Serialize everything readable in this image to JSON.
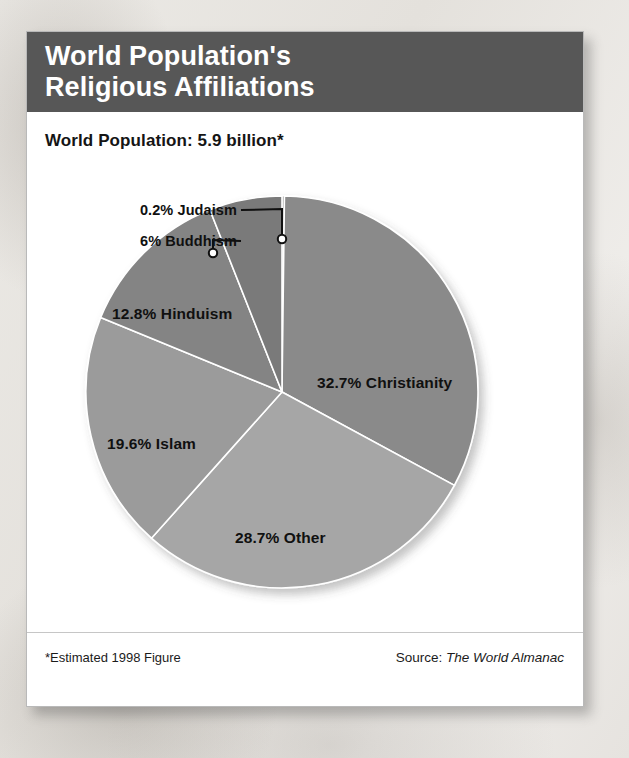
{
  "card": {
    "header": {
      "title_line_1": "World Population's",
      "title_line_2": "Religious Affiliations",
      "background_color": "#575757",
      "text_color": "#ffffff"
    },
    "subtitle": "World Population: 5.9 billion*",
    "footer": {
      "footnote": "*Estimated 1998 Figure",
      "source_prefix": "Source:",
      "source_title": "The World Almanac"
    }
  },
  "chart_data": {
    "type": "pie",
    "title": "World Population's Religious Affiliations",
    "subtitle": "World Population: 5.9 billion*",
    "unit": "percent",
    "total_population": "5.9 billion",
    "start_angle_deg": 0,
    "direction": "clockwise",
    "legend": "none-labels-on-slices",
    "categories": [
      "Judaism",
      "Christianity",
      "Other",
      "Islam",
      "Hinduism",
      "Buddhism"
    ],
    "values": [
      0.2,
      32.7,
      28.7,
      19.6,
      12.8,
      6.0
    ],
    "slices": [
      {
        "name": "Judaism",
        "value": 0.2,
        "label": "0.2% Judaism",
        "color": "#8d8d8d",
        "label_type": "callout",
        "callout_anchor_x": 197,
        "callout_anchor_y": 44
      },
      {
        "name": "Christianity",
        "value": 32.7,
        "label": "32.7% Christianity",
        "color": "#8a8a8a",
        "label_type": "inside",
        "label_x": 232,
        "label_y": 179
      },
      {
        "name": "Other",
        "value": 28.7,
        "label": "28.7% Other",
        "color": "#a6a6a6",
        "label_type": "inside",
        "label_x": 150,
        "label_y": 334
      },
      {
        "name": "Islam",
        "value": 19.6,
        "label": "19.6% Islam",
        "color": "#9b9b9b",
        "label_type": "inside",
        "label_x": 22,
        "label_y": 240
      },
      {
        "name": "Hinduism",
        "value": 12.8,
        "label": "12.8% Hinduism",
        "color": "#848484",
        "label_type": "inside",
        "label_x": 27,
        "label_y": 110
      },
      {
        "name": "Buddhism",
        "value": 6.0,
        "label": "6% Buddhism",
        "color": "#7a7a7a",
        "label_type": "callout",
        "callout_anchor_x": 128,
        "callout_anchor_y": 58
      }
    ],
    "callouts": [
      {
        "name": "Judaism",
        "label": "0.2% Judaism",
        "label_x": 60,
        "label_y": 7,
        "elbow_x": 197,
        "elbow_y": 14,
        "point_x": 197,
        "point_y": 44
      },
      {
        "name": "Buddhism",
        "label": "6% Buddhism",
        "label_x": 60,
        "label_y": 38,
        "elbow_x": 128,
        "elbow_y": 45,
        "point_x": 128,
        "point_y": 58
      }
    ]
  }
}
